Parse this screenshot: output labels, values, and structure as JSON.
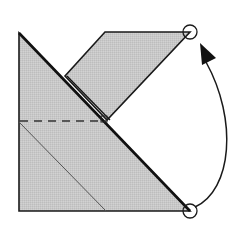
{
  "diagram": {
    "colors": {
      "paper_fill": "#c9c9c9",
      "flap_fill": "#c4c4c4",
      "edge": "#1a1a1a",
      "background": "#ffffff"
    },
    "shapes": {
      "base_triangle": [
        [
          19,
          33
        ],
        [
          19,
          211
        ],
        [
          190,
          211
        ]
      ],
      "top_flap": [
        [
          105,
          32
        ],
        [
          190,
          32
        ],
        [
          107,
          120
        ],
        [
          65,
          76
        ]
      ],
      "hypotenuse": [
        [
          19,
          33
        ],
        [
          190,
          211
        ]
      ],
      "dashed_fold_line": [
        [
          19,
          121
        ],
        [
          107,
          121
        ]
      ],
      "inner_crease": [
        [
          19,
          122
        ],
        [
          106,
          211
        ]
      ]
    },
    "markers": [
      {
        "name": "target-point",
        "cx": 190,
        "cy": 32,
        "r": 7
      },
      {
        "name": "source-point",
        "cx": 190,
        "cy": 211,
        "r": 7
      }
    ],
    "arrow": {
      "from": [
        196,
        206
      ],
      "to": [
        202,
        52
      ],
      "direction": "fold-up",
      "label": "Fold bottom corner to top corner"
    }
  }
}
